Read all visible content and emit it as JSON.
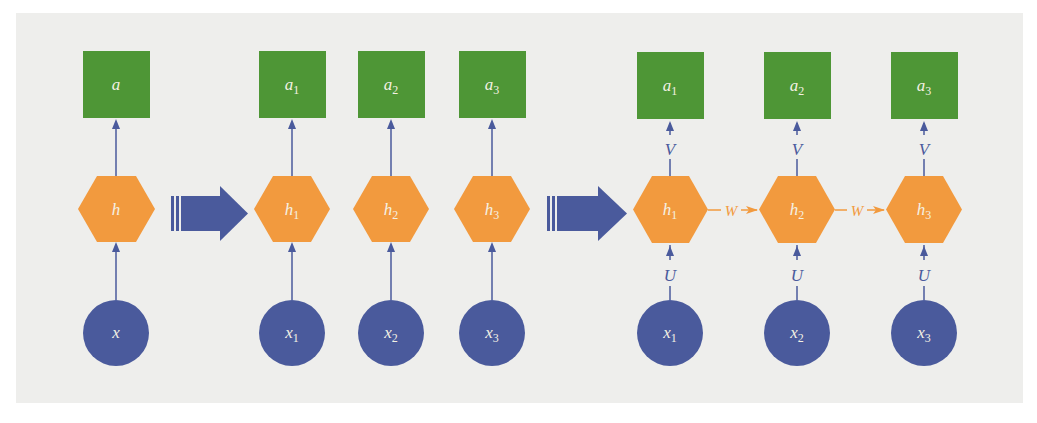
{
  "diagram": {
    "colors": {
      "background": "#eeeeec",
      "output_node": "#4e9636",
      "hidden_node": "#f29a3e",
      "input_node": "#4a5a9c",
      "edge": "#4a5a9c",
      "recurrent_edge": "#f29a3e",
      "node_text": "#f4f1e4"
    },
    "stage1": {
      "output": {
        "base": "a",
        "sub": ""
      },
      "hidden": {
        "base": "h",
        "sub": ""
      },
      "input": {
        "base": "x",
        "sub": ""
      }
    },
    "stage2": {
      "outputs": [
        {
          "base": "a",
          "sub": "1"
        },
        {
          "base": "a",
          "sub": "2"
        },
        {
          "base": "a",
          "sub": "3"
        }
      ],
      "hiddens": [
        {
          "base": "h",
          "sub": "1"
        },
        {
          "base": "h",
          "sub": "2"
        },
        {
          "base": "h",
          "sub": "3"
        }
      ],
      "inputs": [
        {
          "base": "x",
          "sub": "1"
        },
        {
          "base": "x",
          "sub": "2"
        },
        {
          "base": "x",
          "sub": "3"
        }
      ]
    },
    "stage3": {
      "outputs": [
        {
          "base": "a",
          "sub": "1"
        },
        {
          "base": "a",
          "sub": "2"
        },
        {
          "base": "a",
          "sub": "3"
        }
      ],
      "hiddens": [
        {
          "base": "h",
          "sub": "1"
        },
        {
          "base": "h",
          "sub": "2"
        },
        {
          "base": "h",
          "sub": "3"
        }
      ],
      "inputs": [
        {
          "base": "x",
          "sub": "1"
        },
        {
          "base": "x",
          "sub": "2"
        },
        {
          "base": "x",
          "sub": "3"
        }
      ],
      "weight_labels": {
        "input_to_hidden": "U",
        "hidden_to_output": "V",
        "hidden_to_hidden": "W"
      }
    },
    "transition_arrows": [
      "stage1-to-stage2",
      "stage2-to-stage3"
    ]
  }
}
